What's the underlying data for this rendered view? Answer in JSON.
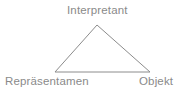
{
  "diagram": {
    "background_color": "#ffffff",
    "stroke_color": "#8c8c8c",
    "text_color": "#8a8a8a",
    "shape": "triangle",
    "nodes": [
      {
        "id": "interpretant",
        "label": "Interpretant",
        "position": "top"
      },
      {
        "id": "repraesentamen",
        "label": "Repräsentamen",
        "position": "bottom-left"
      },
      {
        "id": "objekt",
        "label": "Objekt",
        "position": "bottom-right"
      }
    ],
    "vertices": {
      "apex": {
        "x": 97,
        "y": 25
      },
      "bottom_left": {
        "x": 55,
        "y": 72
      },
      "bottom_right": {
        "x": 150,
        "y": 72
      }
    }
  }
}
